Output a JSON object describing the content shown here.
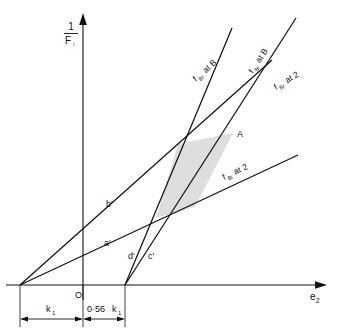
{
  "figure": {
    "background_color": "#ffffff",
    "line_color": "#111111",
    "shade_color": "#d9d9d9",
    "axes": {
      "y_axis": {
        "label_numerator": "1",
        "label_denominator": "F",
        "label_subscript": "i",
        "name": "1/Fi"
      },
      "x_axis": {
        "label_base": "e",
        "label_subscript": "2",
        "name": "e2"
      },
      "origin_label": "O"
    },
    "curve_labels": [
      {
        "id": "fBr-at-B",
        "text": "f    at B",
        "base": "f",
        "sub": "Br",
        "tail": "at B"
      },
      {
        "id": "fBi-at-B",
        "text": "f    at B",
        "base": "f",
        "sub": "Bi",
        "tail": "at B"
      },
      {
        "id": "fBr-at-2",
        "text": "f    at 2",
        "base": "f",
        "sub": "Br",
        "tail": "at 2"
      },
      {
        "id": "fBi-at-2",
        "text": "f    at 2",
        "base": "f",
        "sub": "Bi",
        "tail": "at 2"
      }
    ],
    "point_labels": [
      {
        "id": "point-A",
        "text": "A"
      },
      {
        "id": "line-a-prime",
        "text": "a'"
      },
      {
        "id": "line-b-prime",
        "text": "b'"
      },
      {
        "id": "line-c-prime",
        "text": "c'"
      },
      {
        "id": "line-d-prime",
        "text": "d'"
      }
    ],
    "dimensions": [
      {
        "id": "dim-k1",
        "base": "k",
        "sub": "1",
        "prefix": ""
      },
      {
        "id": "dim-056k1",
        "base": "k",
        "sub": "1",
        "prefix": "0·56"
      }
    ]
  }
}
